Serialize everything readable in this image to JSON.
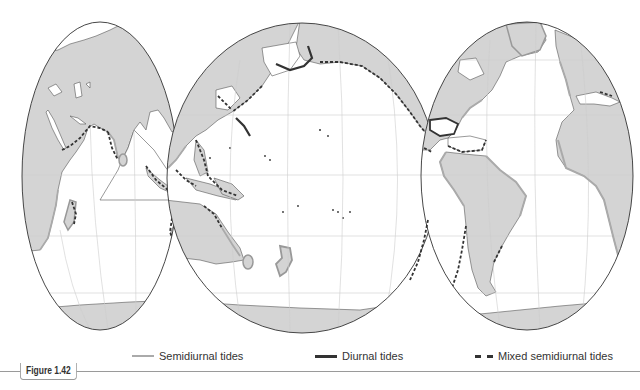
{
  "figure": {
    "label": "Figure 1.42"
  },
  "legend": {
    "items": [
      {
        "id": "semidiurnal",
        "label": "Semidiurnal tides",
        "style": "thin-gray-solid",
        "color": "#aaaaaa"
      },
      {
        "id": "diurnal",
        "label": "Diurnal tides",
        "style": "thick-dark-solid",
        "color": "#333333"
      },
      {
        "id": "mixed",
        "label": "Mixed semidiurnal tides",
        "style": "dark-dashed",
        "color": "#333333"
      }
    ]
  },
  "map": {
    "projection": "interrupted-oval (Goode-like)",
    "land_color": "#d4d4d4",
    "ocean_color": "#ffffff",
    "outline_color": "#333333",
    "graticule_color": "#cccccc",
    "lobes": [
      {
        "name": "indian-ocean-lobe",
        "regions": [
          "Africa",
          "Europe",
          "Asia",
          "India",
          "Australia (west)",
          "Antarctica"
        ]
      },
      {
        "name": "pacific-ocean-lobe",
        "regions": [
          "Asia (east)",
          "Alaska",
          "North America (west)",
          "Australia (east)",
          "New Zealand",
          "Antarctica"
        ]
      },
      {
        "name": "atlantic-ocean-lobe",
        "regions": [
          "North America",
          "South America",
          "Europe",
          "Africa",
          "Greenland",
          "Antarctica"
        ]
      }
    ]
  }
}
